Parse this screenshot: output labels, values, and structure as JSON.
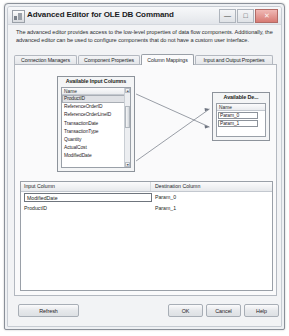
{
  "window": {
    "title": "Advanced Editor for OLE DB Command",
    "icon": "app-icon",
    "controls": {
      "minimize": "—",
      "maximize": "□",
      "close": "✕"
    }
  },
  "description": "The advanced editor provides access to the low-level properties of data flow components. Additionally, the advanced editor can be used to configure components that do not have a custom user interface.",
  "tabs": [
    {
      "label": "Connection Managers",
      "active": false
    },
    {
      "label": "Component Properties",
      "active": false
    },
    {
      "label": "Column Mappings",
      "active": true
    },
    {
      "label": "Input and Output Properties",
      "active": false
    }
  ],
  "input_columns_box": {
    "caption": "Available Input Columns",
    "column_header": "Name",
    "items": [
      "ProductID",
      "ReferenceOrderID",
      "ReferenceOrderLineID",
      "TransactionDate",
      "TransactionType",
      "Quantity",
      "ActualCost",
      "ModifiedDate"
    ],
    "selected": "ProductID",
    "scroll_up": "▲",
    "scroll_down": "▼"
  },
  "destination_columns_box": {
    "caption": "Available De...",
    "column_header": "Name",
    "items": [
      "Param_0",
      "Param_1"
    ]
  },
  "mapping_grid": {
    "headers": {
      "input": "Input Column",
      "destination": "Destination Column"
    },
    "rows": [
      {
        "input": "ModifiedDate",
        "destination": "Param_0",
        "editing": true
      },
      {
        "input": "ProductID",
        "destination": "Param_1",
        "editing": false
      }
    ]
  },
  "footer": {
    "refresh": "Refresh",
    "ok": "OK",
    "cancel": "Cancel",
    "help": "Help"
  },
  "colors": {
    "selection": "#dfe1e5",
    "border": "#8d939b",
    "close_button": "#d77a73"
  }
}
